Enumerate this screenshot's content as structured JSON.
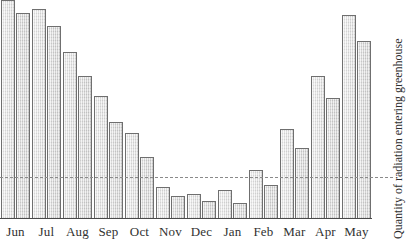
{
  "chart_data": {
    "type": "bar",
    "title": "",
    "xlabel": "",
    "ylabel": "Quantity of radiation entering greenhouse",
    "categories": [
      "Jun",
      "Jul",
      "Aug",
      "Sep",
      "Oct",
      "Nov",
      "Dec",
      "Jan",
      "Feb",
      "Mar",
      "Apr",
      "May"
    ],
    "series": [
      {
        "name": "bar-1",
        "values": [
          100,
          96,
          76,
          56,
          39,
          14,
          11,
          13,
          22,
          41,
          65,
          93
        ]
      },
      {
        "name": "bar-2",
        "values": [
          94,
          88,
          65,
          44,
          28,
          10,
          8,
          7,
          15,
          32,
          55,
          81
        ]
      }
    ],
    "ylim": [
      0,
      100
    ],
    "grid": false,
    "legend_position": "none",
    "annotations": [
      {
        "type": "threshold-line",
        "style": "dashed",
        "value": 19,
        "orientation": "horizontal"
      }
    ],
    "axis": {
      "y_tick_labels": [],
      "x_tick_labels": [
        "Jun",
        "Jul",
        "Aug",
        "Sep",
        "Oct",
        "Nov",
        "Dec",
        "Jan",
        "Feb",
        "Mar",
        "Apr",
        "May"
      ]
    },
    "colors": {
      "bar_fill": "#dcdcdc",
      "bar_fill_light": "#e6e6e6",
      "bar_stroke": "#6f6f6f",
      "axis": "#4a4a4a",
      "threshold": "#8a8a8a",
      "text": "#2e2e2e",
      "background": "#ffffff"
    }
  }
}
